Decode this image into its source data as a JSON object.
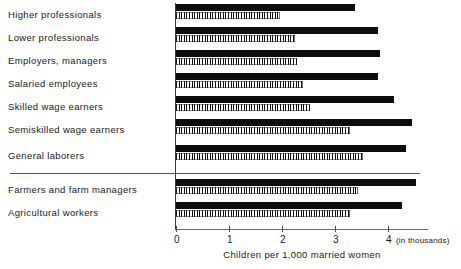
{
  "chart_data": {
    "type": "bar",
    "orientation": "horizontal",
    "title": "",
    "xlabel": "Children per 1,000 married women",
    "xlabel_units": "(in thousands)",
    "ylabel": "",
    "xlim": [
      0,
      4.3
    ],
    "xticks": [
      0,
      1,
      2,
      3,
      4
    ],
    "xticklabels": [
      "0",
      "1",
      "2",
      "3",
      "4"
    ],
    "grid": false,
    "legend": "none",
    "categories": [
      "Higher professionals",
      "Lower professionals",
      "Employers, managers",
      "Salaried employees",
      "Skilled wage earners",
      "Semiskilled wage earners",
      "General laborers",
      "Farmers and farm managers",
      "Agricultural workers"
    ],
    "group_divider_after": "General laborers",
    "series": [
      {
        "name": "solid",
        "style": "solid-black",
        "values": [
          3.38,
          3.81,
          3.85,
          3.81,
          4.11,
          4.45,
          4.34,
          4.53,
          4.26
        ]
      },
      {
        "name": "hatched",
        "style": "vertical-hatch",
        "values": [
          1.96,
          2.25,
          2.28,
          2.4,
          2.53,
          3.28,
          3.53,
          3.43,
          3.28
        ]
      }
    ]
  },
  "axis": {
    "tick_0": "0",
    "tick_1": "1",
    "tick_2": "2",
    "tick_3": "3",
    "tick_4": "4",
    "units_note": "(in thousands)",
    "title": "Children per 1,000 married women"
  },
  "labels": {
    "row0": "Higher  professionals",
    "row1": "Lower  professionals",
    "row2": "Employers,  managers",
    "row3": "Salaried  employees",
    "row4": "Skilled  wage  earners",
    "row5": "Semiskilled  wage  earners",
    "row6": "General  laborers",
    "row7": "Farmers  and  farm  managers",
    "row8": "Agricultural  workers"
  },
  "caption": ""
}
